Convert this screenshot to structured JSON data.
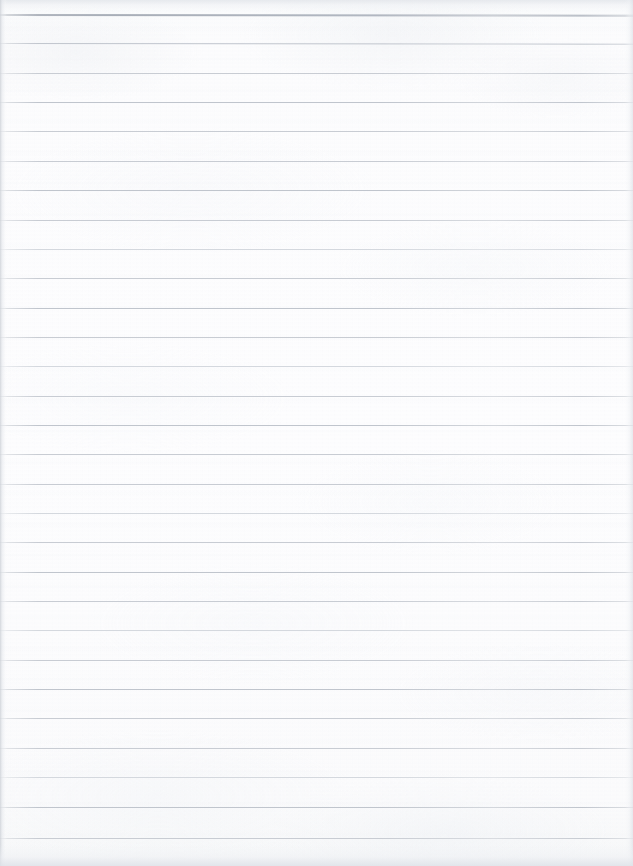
{
  "document": {
    "kind": "scanned-ruled-notebook-page",
    "title": "Blank Ruled Notebook Page",
    "orientation": "portrait",
    "width_px": 633,
    "height_px": 866,
    "has_text_content": false,
    "has_handwriting": false,
    "has_margin_line": false,
    "body_text": ""
  },
  "paper": {
    "background_color": "#fbfbfc",
    "edge_tint_color": "#f2f3f5",
    "texture": "faint mottled scanner grain"
  },
  "ruling": {
    "style": "wide-ruled horizontal lines",
    "line_color": "#c8ccd3",
    "first_line_color": "#aeb4be",
    "line_count": 29,
    "first_line_y": 14,
    "line_spacing_px": 29.35,
    "line_thickness_px": 1,
    "lines": [
      {
        "index": 1,
        "y": 14,
        "weight": "first"
      },
      {
        "index": 2,
        "y": 43.4,
        "weight": "heavy"
      },
      {
        "index": 3,
        "y": 72.7,
        "weight": "normal"
      },
      {
        "index": 4,
        "y": 102.1,
        "weight": "heavy"
      },
      {
        "index": 5,
        "y": 131.4,
        "weight": "normal"
      },
      {
        "index": 6,
        "y": 160.8,
        "weight": "normal"
      },
      {
        "index": 7,
        "y": 190.1,
        "weight": "heavy"
      },
      {
        "index": 8,
        "y": 219.5,
        "weight": "normal"
      },
      {
        "index": 9,
        "y": 248.8,
        "weight": "light"
      },
      {
        "index": 10,
        "y": 278.2,
        "weight": "normal"
      },
      {
        "index": 11,
        "y": 307.5,
        "weight": "heavy"
      },
      {
        "index": 12,
        "y": 336.9,
        "weight": "normal"
      },
      {
        "index": 13,
        "y": 366.2,
        "weight": "light"
      },
      {
        "index": 14,
        "y": 395.6,
        "weight": "normal"
      },
      {
        "index": 15,
        "y": 424.9,
        "weight": "heavy"
      },
      {
        "index": 16,
        "y": 454.3,
        "weight": "normal"
      },
      {
        "index": 17,
        "y": 483.6,
        "weight": "normal"
      },
      {
        "index": 18,
        "y": 513.0,
        "weight": "light"
      },
      {
        "index": 19,
        "y": 542.3,
        "weight": "normal"
      },
      {
        "index": 20,
        "y": 571.7,
        "weight": "heavy"
      },
      {
        "index": 21,
        "y": 601.0,
        "weight": "normal"
      },
      {
        "index": 22,
        "y": 630.4,
        "weight": "light"
      },
      {
        "index": 23,
        "y": 659.7,
        "weight": "normal"
      },
      {
        "index": 24,
        "y": 689.1,
        "weight": "heavy"
      },
      {
        "index": 25,
        "y": 718.4,
        "weight": "normal"
      },
      {
        "index": 26,
        "y": 747.8,
        "weight": "normal"
      },
      {
        "index": 27,
        "y": 777.1,
        "weight": "light"
      },
      {
        "index": 28,
        "y": 806.5,
        "weight": "heavy"
      },
      {
        "index": 29,
        "y": 838.0,
        "weight": "normal"
      }
    ]
  }
}
